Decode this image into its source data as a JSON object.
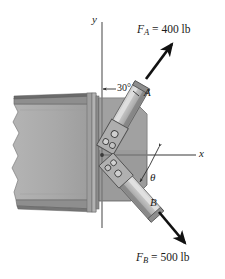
{
  "figure": {
    "background_color": "#ffffff"
  },
  "axes": {
    "y_label": "y",
    "x_label": "x",
    "origin_note": "axes intersect at bracket pin"
  },
  "forces": [
    {
      "name": "F_A",
      "symbol": "F",
      "subscript": "A",
      "equals": "=",
      "magnitude": "400",
      "unit": "lb",
      "text": "F_A = 400 lb",
      "direction": "up-right",
      "color": "#111111"
    },
    {
      "name": "F_B",
      "symbol": "F",
      "subscript": "B",
      "equals": "=",
      "magnitude": "500",
      "unit": "lb",
      "text": "F_B = 500 lb",
      "direction": "down-right",
      "color": "#111111"
    }
  ],
  "members": [
    {
      "name": "member-a",
      "label": "A"
    },
    {
      "name": "member-b",
      "label": "B"
    }
  ],
  "angles": [
    {
      "name": "angle-30",
      "label": "30°",
      "from": "y-axis",
      "to": "member-a"
    },
    {
      "name": "angle-theta",
      "label": "θ",
      "from": "x-axis",
      "to": "member-b"
    }
  ],
  "colors": {
    "beam_face": "#a9a9a9",
    "beam_flange": "#8d8d8d",
    "beam_flange_dark": "#6f6f6f",
    "gusset": "#9a9a9a",
    "gusset_edge": "#5e5e5e",
    "bar_light": "#c9c9c9",
    "bar_mid": "#a3a3a3",
    "bar_dark": "#7a7a7a",
    "axis_line": "#6b6b6b",
    "arrow": "#111111",
    "text": "#1a1a1a"
  }
}
